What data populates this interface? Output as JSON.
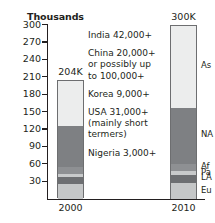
{
  "chart_data": {
    "type": "bar",
    "title": "",
    "subtitle": "",
    "ylabel": "Thousands",
    "xlabel": "",
    "grid": false,
    "legend_position": "right-of-last-bar",
    "ylim": [
      0,
      300
    ],
    "ytick_step": 30,
    "ytick_labels": [
      "300",
      "270",
      "240",
      "210",
      "180",
      "150",
      "120",
      "90",
      "60",
      "30"
    ],
    "categories": [
      "2000",
      "2010"
    ],
    "bar_total_labels": [
      "204K",
      "300K"
    ],
    "bar_totals": [
      204,
      300
    ],
    "series": [
      {
        "name": "As",
        "label": "As",
        "color": "#eceded",
        "values": [
          78,
          143
        ]
      },
      {
        "name": "NA",
        "label": "NA",
        "color": "#7e8083",
        "values": [
          70,
          95
        ]
      },
      {
        "name": "Af",
        "label": "Af",
        "color": "#8e9093",
        "values": [
          12,
          13
        ]
      },
      {
        "name": "Pa",
        "label": "Pa",
        "color": "#c8cacb",
        "values": [
          5,
          7
        ]
      },
      {
        "name": "LA",
        "label": "LA",
        "color": "#6d6f72",
        "values": [
          12,
          13
        ]
      },
      {
        "name": "Eu",
        "label": "Eu",
        "color": "#c5c7c8",
        "values": [
          27,
          29
        ]
      }
    ],
    "annotations": [
      {
        "id": "india",
        "lines": [
          "India 42,000+"
        ]
      },
      {
        "id": "china",
        "lines": [
          "China 20,000+",
          "or possibly up",
          "to 100,000+"
        ]
      },
      {
        "id": "korea",
        "lines": [
          "Korea 9,000+"
        ]
      },
      {
        "id": "usa",
        "lines": [
          "USA 31,000+",
          "(mainly short",
          "termers)"
        ]
      },
      {
        "id": "nigeria",
        "lines": [
          "Nigeria 3,000+"
        ]
      }
    ]
  },
  "colors": {
    "axis": "#231f20",
    "bar_outline": "#6d6e70",
    "text": "#231f20",
    "background": "#ffffff"
  }
}
